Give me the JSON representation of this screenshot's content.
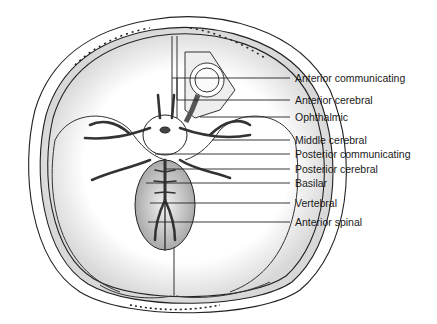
{
  "diagram": {
    "labels": [
      {
        "text": "Anterior communicating",
        "y": 78,
        "line_from_x": 177
      },
      {
        "text": "Anterior cerebral",
        "y": 100,
        "line_from_x": 177
      },
      {
        "text": "Ophthalmic",
        "y": 117,
        "line_from_x": 200
      },
      {
        "text": "Middle cerebral",
        "y": 140,
        "line_from_x": 212
      },
      {
        "text": "Posterior communicating",
        "y": 154,
        "line_from_x": 155
      },
      {
        "text": "Posterior cerebral",
        "y": 169,
        "line_from_x": 165
      },
      {
        "text": "Basilar",
        "y": 183,
        "line_from_x": 146
      },
      {
        "text": "Vertebral",
        "y": 203,
        "line_from_x": 150
      },
      {
        "text": "Anterior spinal",
        "y": 222,
        "line_from_x": 148
      }
    ]
  }
}
